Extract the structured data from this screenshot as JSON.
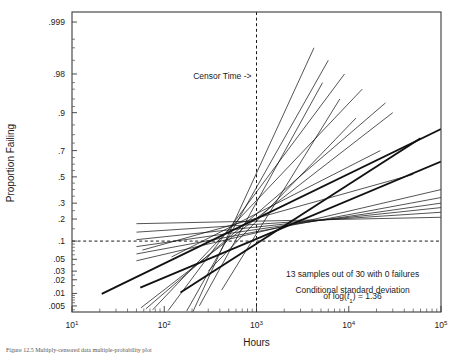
{
  "chart_data": {
    "type": "line",
    "title": "",
    "xlabel": "Hours",
    "ylabel": "Proportion Failing",
    "scale": {
      "x": "log10",
      "y": "lognormal-probability"
    },
    "xlim": [
      10,
      100000
    ],
    "ylim": [
      0.0035,
      0.9995
    ],
    "grid": false,
    "legend": null,
    "x_tick_labels": [
      "10",
      "10",
      "10",
      "10",
      "10"
    ],
    "x_tick_exponents": [
      "1",
      "2",
      "3",
      "4",
      "5"
    ],
    "x_tick_values": [
      10,
      100,
      1000,
      10000,
      100000
    ],
    "y_tick_labels": [
      ".999",
      ".98",
      ".9",
      ".7",
      ".5",
      ".3",
      ".2",
      ".1",
      ".05",
      ".03",
      ".02",
      ".01",
      ".005"
    ],
    "y_tick_values": [
      0.999,
      0.98,
      0.9,
      0.7,
      0.5,
      0.3,
      0.2,
      0.1,
      0.05,
      0.03,
      0.02,
      0.01,
      0.005
    ],
    "reference_lines": [
      {
        "name": "censor-time",
        "orientation": "vertical",
        "x": 1000,
        "style": "dashed",
        "label": "Censor Time ->"
      },
      {
        "name": "proportion-0.1",
        "orientation": "horizontal",
        "y": 0.1,
        "style": "dashed",
        "label": ""
      }
    ],
    "convergence_point": {
      "x": 1000,
      "y": 0.2
    },
    "series_note": "13 individual fitted lognormal lines, all passing near (1000 hours, 0.2 proportion failing); each defined by two endpoints (hours, proportion).",
    "series": [
      {
        "name": "line-1",
        "weight": "bold",
        "points": [
          [
            21,
            0.0098
          ],
          [
            100000,
            0.83
          ]
        ]
      },
      {
        "name": "line-2",
        "weight": "bold",
        "points": [
          [
            55,
            0.0135
          ],
          [
            100000,
            0.62
          ]
        ]
      },
      {
        "name": "line-3",
        "weight": "bold",
        "points": [
          [
            150,
            0.0105
          ],
          [
            60000,
            0.78
          ]
        ]
      },
      {
        "name": "line-4",
        "weight": "normal",
        "points": [
          [
            56,
            0.0045
          ],
          [
            30000,
            0.9
          ]
        ]
      },
      {
        "name": "line-5",
        "weight": "normal",
        "points": [
          [
            63,
            0.0042
          ],
          [
            25000,
            0.93
          ]
        ]
      },
      {
        "name": "line-6",
        "weight": "normal",
        "points": [
          [
            75,
            0.004
          ],
          [
            14000,
            0.96
          ]
        ]
      },
      {
        "name": "line-7",
        "weight": "normal",
        "points": [
          [
            110,
            0.0038
          ],
          [
            9000,
            0.98
          ]
        ]
      },
      {
        "name": "line-8",
        "weight": "normal",
        "points": [
          [
            175,
            0.0037
          ],
          [
            6000,
            0.99
          ]
        ]
      },
      {
        "name": "line-9",
        "weight": "normal",
        "points": [
          [
            205,
            0.0036
          ],
          [
            4200,
            0.995
          ]
        ]
      },
      {
        "name": "line-10",
        "weight": "normal",
        "points": [
          [
            50,
            0.047
          ],
          [
            100000,
            0.4
          ]
        ]
      },
      {
        "name": "line-11",
        "weight": "normal",
        "points": [
          [
            50,
            0.062
          ],
          [
            100000,
            0.34
          ]
        ]
      },
      {
        "name": "line-12",
        "weight": "normal",
        "points": [
          [
            50,
            0.082
          ],
          [
            100000,
            0.3
          ]
        ]
      },
      {
        "name": "line-13",
        "weight": "normal",
        "points": [
          [
            50,
            0.105
          ],
          [
            100000,
            0.27
          ]
        ]
      },
      {
        "name": "line-14",
        "weight": "normal",
        "points": [
          [
            50,
            0.135
          ],
          [
            100000,
            0.24
          ]
        ]
      },
      {
        "name": "line-15",
        "weight": "normal",
        "points": [
          [
            50,
            0.175
          ],
          [
            100000,
            0.21
          ]
        ]
      },
      {
        "name": "line-16",
        "weight": "normal",
        "points": [
          [
            58,
            0.072
          ],
          [
            50000,
            0.52
          ]
        ]
      },
      {
        "name": "line-17",
        "weight": "normal",
        "points": [
          [
            120,
            0.055
          ],
          [
            22000,
            0.7
          ]
        ]
      },
      {
        "name": "line-18",
        "weight": "normal",
        "points": [
          [
            300,
            0.03
          ],
          [
            12000,
            0.88
          ]
        ]
      },
      {
        "name": "line-19",
        "weight": "normal",
        "points": [
          [
            420,
            0.012
          ],
          [
            8000,
            0.94
          ]
        ]
      },
      {
        "name": "line-20",
        "weight": "normal",
        "points": [
          [
            240,
            0.005
          ],
          [
            5200,
            0.97
          ]
        ]
      }
    ],
    "annotations": [
      {
        "name": "sample-count-note",
        "text": "13 samples out of 30 with 0 failures",
        "x": 11000,
        "y": 0.023
      },
      {
        "name": "sd-note-line1",
        "text": "Conditional standard deviation",
        "x": 11000,
        "y": 0.0105
      },
      {
        "name": "sd-note-line2-prefix",
        "text": "of log(",
        "x": 11000,
        "y": 0.0072
      },
      {
        "name": "sd-note-variable",
        "text": "t",
        "subscript": "1",
        "suffix": ") = 1.36"
      }
    ]
  },
  "labels": {
    "censor_time": "Censor Time ->",
    "sample_note": "13 samples out of 30 with 0 failures",
    "sd_line1": "Conditional standard deviation",
    "sd_prefix": "of log(",
    "sd_var": "t",
    "sd_sub": "1",
    "sd_suffix": ") = 1.36",
    "x_axis_title": "Hours",
    "y_axis_title": "Proportion Failing"
  },
  "caption": {
    "text": "Figure 12.5  Multiply-censored data  multiple-probability plot"
  },
  "colors": {
    "line": "#111111",
    "axis": "#3a3a3a",
    "text": "#1a1a1a",
    "background": "#ffffff"
  }
}
